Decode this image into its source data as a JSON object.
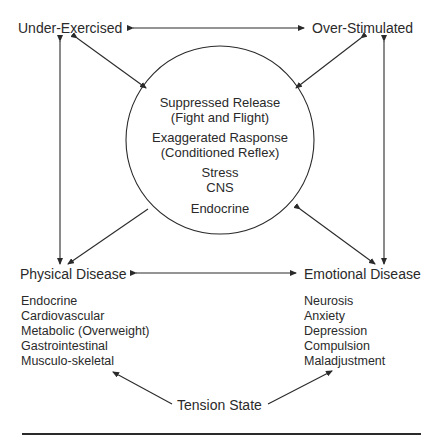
{
  "nodes": {
    "under_exercised": "Under-Exercised",
    "over_stimulated": "Over-Stimulated",
    "physical_disease": "Physical Disease",
    "emotional_disease": "Emotional Disease",
    "tension_state": "Tension State"
  },
  "center_circle": {
    "lines": [
      "Suppressed Release",
      "(Fight and Flight)",
      "Exaggerated Rasponse",
      "(Conditioned Reflex)",
      "Stress",
      "CNS",
      "Endocrine"
    ]
  },
  "physical_disease_list": [
    "Endocrine",
    "Cardiovascular",
    "Metabolic (Overweight)",
    "Gastrointestinal",
    "Musculo-skeletal"
  ],
  "emotional_disease_list": [
    "Neurosis",
    "Anxiety",
    "Depression",
    "Compulsion",
    "Maladjustment"
  ],
  "colors": {
    "line": "#2a2a2a",
    "text": "#2a2a2a",
    "background": "#ffffff"
  }
}
